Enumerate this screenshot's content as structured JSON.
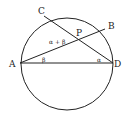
{
  "diagram": {
    "type": "circle-geometry",
    "circle": {
      "cx": 67,
      "cy": 64,
      "r": 46
    },
    "points": {
      "A": {
        "label": "A",
        "x": 20,
        "y": 63
      },
      "B": {
        "label": "B",
        "x": 105,
        "y": 29
      },
      "C": {
        "label": "C",
        "x": 44,
        "y": 14
      },
      "D": {
        "label": "D",
        "x": 113,
        "y": 63
      },
      "P": {
        "label": "P",
        "x": 78,
        "y": 40
      }
    },
    "segments": [
      [
        "A",
        "B"
      ],
      [
        "C",
        "D"
      ],
      [
        "A",
        "D"
      ]
    ],
    "angle_labels": {
      "apb": "α + β",
      "bad": "β",
      "adc": "α"
    },
    "colors": {
      "stroke": "#222222",
      "background": "#ffffff"
    }
  }
}
